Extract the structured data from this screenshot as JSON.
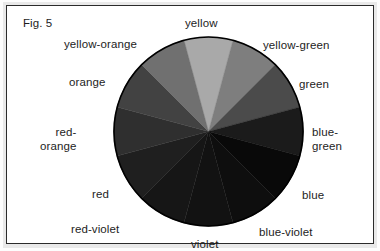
{
  "figure": {
    "caption": "Fig. 5",
    "frame_color": "#2b2b2b",
    "background_color": "#ffffff"
  },
  "chart_data": {
    "type": "pie",
    "title": "Fig. 5",
    "subtitle": "",
    "xlabel": "",
    "ylabel": "",
    "legend_position": "around-pie",
    "grid": false,
    "note": "Twelve-part color wheel reproduced in grayscale; all twelve slices are equal 30-degree wedges.",
    "categories": [
      "yellow",
      "yellow-green",
      "green",
      "blue-green",
      "blue",
      "blue-violet",
      "violet",
      "red-violet",
      "red",
      "red-orange",
      "orange",
      "yellow-orange"
    ],
    "values": [
      30,
      30,
      30,
      30,
      30,
      30,
      30,
      30,
      30,
      30,
      30,
      30
    ],
    "slices": [
      {
        "label": "yellow",
        "start_deg": -15,
        "end_deg": 15,
        "fill": "#a9a9a9",
        "label_pos": "top"
      },
      {
        "label": "yellow-green",
        "start_deg": 15,
        "end_deg": 45,
        "fill": "#7e7e7e",
        "label_pos": "top-right"
      },
      {
        "label": "green",
        "start_deg": 45,
        "end_deg": 75,
        "fill": "#4b4b4b",
        "label_pos": "right-upper"
      },
      {
        "label": "blue-green",
        "start_deg": 75,
        "end_deg": 105,
        "fill": "#1b1b1b",
        "label_pos": "right"
      },
      {
        "label": "blue",
        "start_deg": 105,
        "end_deg": 135,
        "fill": "#090909",
        "label_pos": "right-lower"
      },
      {
        "label": "blue-violet",
        "start_deg": 135,
        "end_deg": 165,
        "fill": "#0e0e0e",
        "label_pos": "bottom-right"
      },
      {
        "label": "violet",
        "start_deg": 165,
        "end_deg": 195,
        "fill": "#121212",
        "label_pos": "bottom"
      },
      {
        "label": "red-violet",
        "start_deg": 195,
        "end_deg": 225,
        "fill": "#161616",
        "label_pos": "bottom-left"
      },
      {
        "label": "red",
        "start_deg": 225,
        "end_deg": 255,
        "fill": "#1f1f1f",
        "label_pos": "left-lower"
      },
      {
        "label": "red-orange",
        "start_deg": 255,
        "end_deg": 285,
        "fill": "#2f2f2f",
        "label_pos": "left"
      },
      {
        "label": "orange",
        "start_deg": 285,
        "end_deg": 315,
        "fill": "#424242",
        "label_pos": "left-upper"
      },
      {
        "label": "yellow-orange",
        "start_deg": 315,
        "end_deg": 345,
        "fill": "#707070",
        "label_pos": "top-left"
      }
    ],
    "outline_color": "#000000",
    "center_x": 201,
    "center_y": 126,
    "radius": 95
  },
  "labels": {
    "yellow": "yellow",
    "yellow_green": "yellow-green",
    "green": "green",
    "blue_green": "blue-\ngreen",
    "blue": "blue",
    "blue_violet": "blue-violet",
    "violet": "violet",
    "red_violet": "red-violet",
    "red": "red",
    "red_orange": "red-\norange",
    "orange": "orange",
    "yellow_orange": "yellow-orange"
  }
}
